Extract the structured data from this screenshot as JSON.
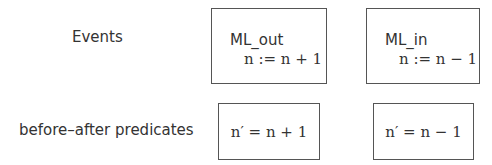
{
  "rows": {
    "events_label": "Events",
    "predicates_label": "before–after predicates"
  },
  "events": [
    {
      "name": "ML_out",
      "action": "n := n + 1"
    },
    {
      "name": "ML_in",
      "action": "n := n − 1"
    }
  ],
  "predicates": [
    {
      "text": "n′ = n + 1"
    },
    {
      "text": "n′ = n − 1"
    }
  ]
}
